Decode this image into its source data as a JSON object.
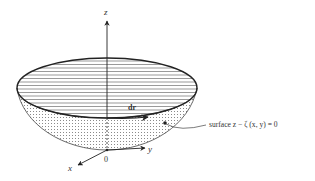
{
  "figure": {
    "axes": {
      "z_label": "z",
      "y_label": "y",
      "x_label": "x",
      "origin_label": "0"
    },
    "vector_label": "dr",
    "surface_label": "surface z − ζ (x, y)  = 0",
    "colors": {
      "line": "#333333",
      "hatch": "#555555",
      "stipple": "#8a8a8a",
      "background": "#ffffff"
    }
  }
}
